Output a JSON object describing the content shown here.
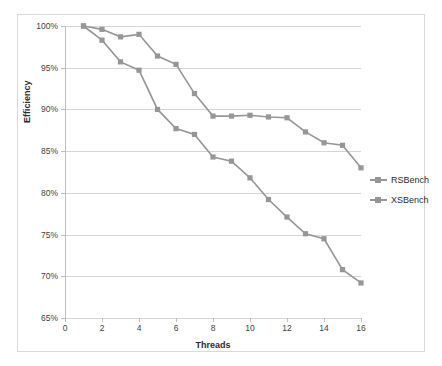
{
  "chart_data": {
    "type": "line",
    "title": "",
    "xlabel": "Threads",
    "ylabel": "Efficiency",
    "x": [
      1,
      2,
      3,
      4,
      5,
      6,
      7,
      8,
      9,
      10,
      11,
      12,
      13,
      14,
      15,
      16
    ],
    "xlim": [
      0,
      16
    ],
    "ylim": [
      65,
      100
    ],
    "x_tick_labels": [
      "0",
      "2",
      "4",
      "6",
      "8",
      "10",
      "12",
      "14",
      "16"
    ],
    "x_ticks": [
      0,
      2,
      4,
      6,
      8,
      10,
      12,
      14,
      16
    ],
    "y_tick_labels": [
      "65%",
      "70%",
      "75%",
      "80%",
      "85%",
      "90%",
      "95%",
      "100%"
    ],
    "y_ticks": [
      65,
      70,
      75,
      80,
      85,
      90,
      95,
      100
    ],
    "grid": "horizontal",
    "legend_position": "right",
    "series": [
      {
        "name": "RSBench",
        "color": "#969696",
        "marker": "square",
        "values": [
          100.0,
          99.6,
          98.7,
          99.0,
          96.4,
          95.4,
          91.9,
          89.2,
          89.2,
          89.3,
          89.1,
          89.0,
          87.3,
          86.0,
          85.7,
          83.0
        ]
      },
      {
        "name": "XSBench",
        "color": "#969696",
        "marker": "square",
        "values": [
          100.0,
          98.3,
          95.7,
          94.7,
          90.0,
          87.7,
          87.0,
          84.3,
          83.8,
          81.8,
          79.2,
          77.1,
          75.1,
          74.5,
          70.8,
          69.2
        ]
      }
    ]
  },
  "legend": {
    "items": [
      {
        "label": "RSBench"
      },
      {
        "label": "XSBench"
      }
    ]
  },
  "colors": {
    "series": "#969696",
    "grid": "#d6d6d6",
    "axis": "#bdbdbd",
    "border": "#d9d9d9",
    "text": "#3f3f3f",
    "background": "#ffffff"
  }
}
